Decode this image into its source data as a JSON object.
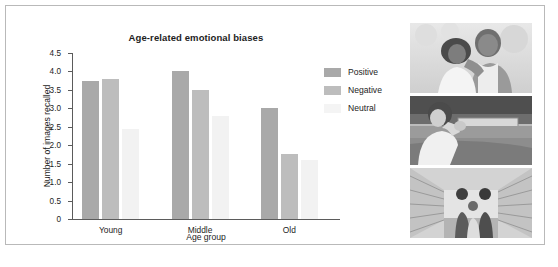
{
  "chart_data": {
    "type": "bar",
    "title": "Age-related emotional biases",
    "xlabel": "Age group",
    "ylabel": "Number of images recalled",
    "categories": [
      "Young",
      "Middle",
      "Old"
    ],
    "series": [
      {
        "name": "Positive",
        "values": [
          3.75,
          4.0,
          3.0
        ],
        "color": "#a9a9a9"
      },
      {
        "name": "Negative",
        "values": [
          3.8,
          3.5,
          1.75
        ],
        "color": "#bdbdbd"
      },
      {
        "name": "Neutral",
        "values": [
          2.45,
          2.8,
          1.6
        ],
        "color": "#f2f2f2"
      }
    ],
    "ylim": [
      0,
      4.5
    ],
    "yticks": [
      "0",
      "0.5",
      "1.0",
      "1.5",
      "2.0",
      "2.5",
      "3.0",
      "3.5",
      "4.0",
      "4.5"
    ],
    "ytick_values": [
      0,
      0.5,
      1.0,
      1.5,
      2.0,
      2.5,
      3.0,
      3.5,
      4.0,
      4.5
    ],
    "grid": false,
    "legend_position": "right"
  },
  "legend": {
    "entries": [
      {
        "label": "Positive"
      },
      {
        "label": "Negative"
      },
      {
        "label": "Neutral"
      }
    ]
  },
  "photos": [
    {
      "caption": "older-couple-embracing-outdoors"
    },
    {
      "caption": "woman-seated-outdoors-landscape"
    },
    {
      "caption": "family-shopping-supermarket-aisle"
    }
  ]
}
